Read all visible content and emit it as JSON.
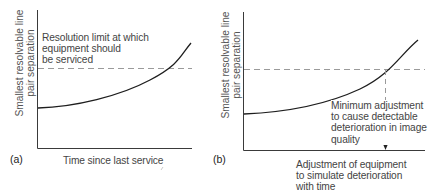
{
  "panels": [
    {
      "id": "a",
      "tag": "(a)",
      "y_axis_label_line1": "Smallest resolvable line",
      "y_axis_label_line2": "pair separation",
      "x_axis_label": "Time since last service",
      "annotation_line1": "Resolution limit at which",
      "annotation_line2": "equipment should",
      "annotation_line3": "be serviced"
    },
    {
      "id": "b",
      "tag": "(b)",
      "y_axis_label_line1": "Smallest resolvable line",
      "y_axis_label_line2": "pair separation",
      "x_axis_label_line1": "Adjustment of equipment",
      "x_axis_label_line2": "to simulate deterioration",
      "x_axis_label_line3": "with time",
      "annotation_line1": "Minimum adjustment",
      "annotation_line2": "to cause detectable",
      "annotation_line3": "deterioration in image",
      "annotation_line4": "quality"
    }
  ],
  "colors": {
    "axis": "#333333",
    "curve": "#1a1a1a",
    "dashed": "#9a9a9a",
    "text": "#444444"
  }
}
